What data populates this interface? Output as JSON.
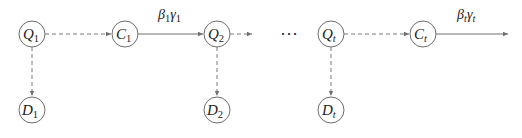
{
  "diagram": {
    "type": "flow-diagram",
    "colors": {
      "stroke": "#6e6e6e",
      "text": "#222222",
      "background": "#ffffff"
    },
    "nodes": [
      {
        "id": "Q1",
        "symbol": "Q",
        "sub": "1",
        "x": 32,
        "y": 34
      },
      {
        "id": "C1",
        "symbol": "C",
        "sub": "1",
        "x": 125,
        "y": 34
      },
      {
        "id": "Q2",
        "symbol": "Q",
        "sub": "2",
        "x": 217,
        "y": 34
      },
      {
        "id": "Qt",
        "symbol": "Q",
        "sub": "t",
        "x": 331,
        "y": 34
      },
      {
        "id": "Ct",
        "symbol": "C",
        "sub": "t",
        "x": 423,
        "y": 34
      },
      {
        "id": "D1",
        "symbol": "D",
        "sub": "1",
        "x": 32,
        "y": 110
      },
      {
        "id": "D2",
        "symbol": "D",
        "sub": "2",
        "x": 217,
        "y": 110
      },
      {
        "id": "Dt",
        "symbol": "D",
        "sub": "t",
        "x": 331,
        "y": 110
      }
    ],
    "edges": [
      {
        "from": "Q1",
        "to": "C1",
        "style": "dashed"
      },
      {
        "from": "C1",
        "to": "Q2",
        "style": "solid",
        "label": {
          "b": "β",
          "b_sub": "1",
          "g": "γ",
          "g_sub": "1"
        }
      },
      {
        "from": "Q2",
        "to": "next",
        "style": "dashed"
      },
      {
        "from": "Qt",
        "to": "Ct",
        "style": "dashed"
      },
      {
        "from": "Ct",
        "to": "out",
        "style": "solid",
        "label": {
          "b": "β",
          "b_sub": "t",
          "g": "γ",
          "g_sub": "t"
        }
      },
      {
        "from": "Q1",
        "to": "D1",
        "style": "dashed"
      },
      {
        "from": "Q2",
        "to": "D2",
        "style": "dashed"
      },
      {
        "from": "Qt",
        "to": "Dt",
        "style": "dashed"
      }
    ],
    "ellipsis": "⋯"
  }
}
